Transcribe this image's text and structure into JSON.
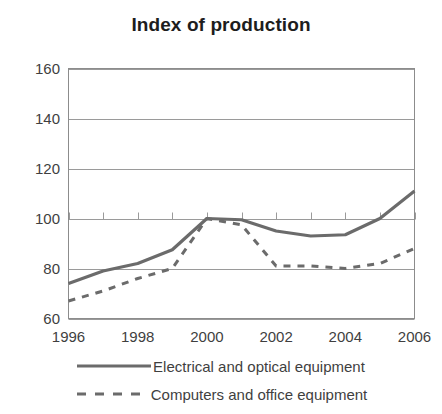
{
  "chart_data": {
    "type": "line",
    "title": "Index of production",
    "xlabel": "",
    "ylabel": "",
    "x": [
      1996,
      1997,
      1998,
      1999,
      2000,
      2001,
      2002,
      2003,
      2004,
      2005,
      2006
    ],
    "xlim": [
      1996,
      2006
    ],
    "ylim": [
      60,
      160
    ],
    "xticks": [
      1996,
      1997,
      1998,
      1999,
      2000,
      2001,
      2002,
      2003,
      2004,
      2005,
      2006
    ],
    "xtick_labels": [
      "1996",
      "",
      "1998",
      "",
      "2000",
      "",
      "2002",
      "",
      "2004",
      "",
      "2006"
    ],
    "yticks": [
      60,
      80,
      100,
      120,
      140,
      160
    ],
    "ytick_labels": [
      "60",
      "80",
      "100",
      "120",
      "140",
      "160"
    ],
    "grid": "horizontal",
    "legend_position": "bottom",
    "series": [
      {
        "name": "Electrical and optical equipment",
        "style": "solid",
        "color": "#6b6b6b",
        "values": [
          74,
          79,
          82,
          87.5,
          100,
          99.5,
          95,
          93,
          93.5,
          100,
          111
        ]
      },
      {
        "name": "Computers and office equipment",
        "style": "dashed",
        "color": "#6b6b6b",
        "values": [
          67,
          71,
          76,
          80,
          100,
          97.5,
          81,
          81,
          80,
          82,
          88
        ]
      }
    ]
  },
  "colors": {
    "axis": "#8c8c8c",
    "grid": "#9a9a9a",
    "text": "#3f3f3f",
    "title": "#1d1d1d",
    "line": "#6b6b6b",
    "background": "#ffffff"
  }
}
